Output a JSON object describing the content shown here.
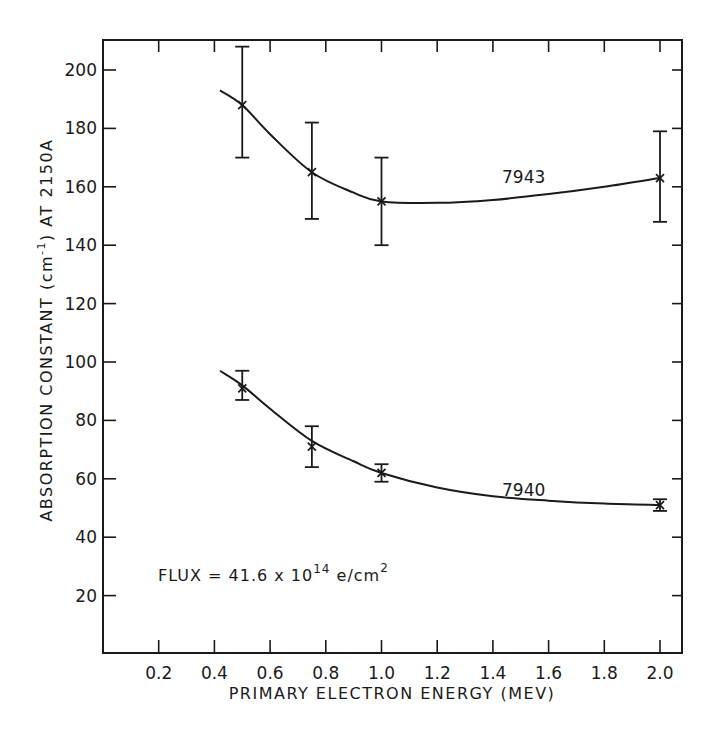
{
  "chart_data": {
    "type": "line",
    "title": "",
    "xlabel": "PRIMARY ELECTRON ENERGY  (MEV)",
    "ylabel": "ABSORPTION CONSTANT (cm⁻¹)  AT 2150A",
    "xlim": [
      0,
      2.08
    ],
    "ylim": [
      0,
      210
    ],
    "x_ticks": [
      0.2,
      0.4,
      0.6,
      0.8,
      1.0,
      1.2,
      1.4,
      1.6,
      1.8,
      2.0
    ],
    "x_tick_labels": [
      "0.2",
      "0.4",
      "0.6",
      "0.8",
      "1.0",
      "1.2",
      "1.4",
      "1.6",
      "1.8",
      "2.0"
    ],
    "y_ticks": [
      20,
      40,
      60,
      80,
      100,
      120,
      140,
      160,
      180,
      200
    ],
    "y_tick_labels": [
      "20",
      "40",
      "60",
      "80",
      "100",
      "120",
      "140",
      "160",
      "180",
      "200"
    ],
    "grid": false,
    "legend": "inline labels",
    "series": [
      {
        "name": "7943",
        "x": [
          0.5,
          0.75,
          1.0,
          2.0
        ],
        "y": [
          188,
          165,
          155,
          163
        ],
        "yerr_low": [
          170,
          149,
          140,
          148
        ],
        "yerr_high": [
          208,
          182,
          170,
          179
        ],
        "curve": [
          [
            0.42,
            193
          ],
          [
            0.5,
            188
          ],
          [
            0.6,
            178
          ],
          [
            0.75,
            165
          ],
          [
            0.9,
            158
          ],
          [
            1.0,
            155
          ],
          [
            1.2,
            154.5
          ],
          [
            1.4,
            155.5
          ],
          [
            1.6,
            157.5
          ],
          [
            1.8,
            160
          ],
          [
            2.0,
            163
          ]
        ]
      },
      {
        "name": "7940",
        "x": [
          0.5,
          0.75,
          1.0,
          2.0
        ],
        "y": [
          91,
          71,
          62,
          51
        ],
        "yerr_low": [
          87,
          64,
          59,
          49
        ],
        "yerr_high": [
          97,
          78,
          65,
          53
        ],
        "curve": [
          [
            0.42,
            97
          ],
          [
            0.5,
            92
          ],
          [
            0.6,
            84
          ],
          [
            0.75,
            73
          ],
          [
            0.9,
            66
          ],
          [
            1.0,
            62
          ],
          [
            1.2,
            57
          ],
          [
            1.4,
            54
          ],
          [
            1.6,
            52.5
          ],
          [
            1.8,
            51.5
          ],
          [
            2.0,
            51
          ]
        ]
      }
    ],
    "annotations": [
      {
        "text": "7943",
        "x": 1.4,
        "y": 161
      },
      {
        "text": "7940",
        "x": 1.4,
        "y": 57
      },
      {
        "text": "FLUX = 41.6 x 10^14 e/cm^2",
        "x": 0.2,
        "y": 27
      }
    ]
  },
  "labels": {
    "xlabel": "PRIMARY ELECTRON ENERGY  (MEV)",
    "ylabel_main": "ABSORPTION CONSTANT (cm",
    "ylabel_sup": "-1",
    "ylabel_tail": ")  AT 2150A",
    "series_7943": "7943",
    "series_7940": "7940",
    "flux_prefix": "FLUX = 41.6 x 10",
    "flux_exp": "14",
    "flux_unit": " e/cm",
    "flux_unit_exp": "2"
  },
  "colors": {
    "ink": "#1a1a1a",
    "background": "#ffffff"
  }
}
